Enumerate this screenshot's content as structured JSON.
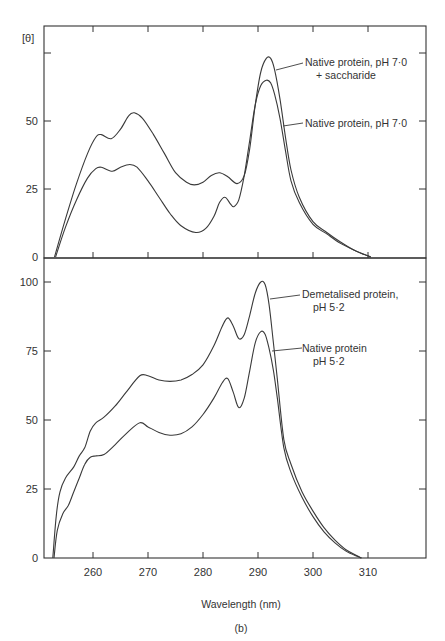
{
  "figure": {
    "panel_label": "(b)",
    "xlabel": "Wavelength (nm)",
    "ylabel": "[θ]"
  },
  "chart_data": [
    {
      "type": "line",
      "title": "",
      "xlabel": "Wavelength (nm)",
      "ylabel": "[θ]",
      "xlim": [
        250,
        320
      ],
      "ylim": [
        0,
        85
      ],
      "yticks": [
        0,
        25,
        50,
        75
      ],
      "ytick_labels": [
        "0",
        "25",
        "50",
        ""
      ],
      "xticks": [
        260,
        270,
        280,
        290,
        300,
        310
      ],
      "grid": false,
      "series": [
        {
          "name": "Native protein, pH 7·0 + saccharide",
          "label_lines": [
            "Native protein, pH 7·0",
            "+ saccharide"
          ],
          "x": [
            253,
            255,
            257,
            259,
            260.5,
            261.5,
            263.3,
            265,
            266.5,
            267.5,
            269,
            271,
            273,
            275,
            277,
            278.4,
            280,
            281.5,
            283,
            284.5,
            286.2,
            287.5,
            288.5,
            289.5,
            290.5,
            291.5,
            292.3,
            293,
            294,
            295,
            296,
            297.5,
            300,
            302.5,
            305,
            307.5,
            310.5
          ],
          "y": [
            0,
            14,
            27,
            38,
            44,
            45,
            43.5,
            47,
            52,
            53,
            51,
            45,
            38,
            31,
            27.5,
            26.5,
            27.5,
            30,
            31,
            29.5,
            27,
            30,
            40,
            56,
            68,
            73,
            73,
            69,
            58,
            44,
            32,
            22,
            13,
            9,
            5.5,
            2.5,
            0
          ]
        },
        {
          "name": "Native protein, pH 7·0",
          "label_lines": [
            "Native protein, pH 7·0"
          ],
          "x": [
            253.2,
            255,
            257,
            259,
            260.5,
            261.5,
            263.5,
            265,
            266.7,
            268,
            270,
            272,
            274,
            276,
            278.7,
            280.5,
            282,
            283,
            284,
            285,
            285.6,
            286.5,
            287.5,
            288.5,
            289.5,
            290.5,
            291.5,
            292.3,
            293,
            294,
            295,
            296,
            297.5,
            300,
            302.5,
            305,
            307.5,
            310.5
          ],
          "y": [
            0,
            11,
            21,
            29,
            32.5,
            33,
            31.5,
            33,
            34,
            33,
            28,
            22,
            16,
            11.5,
            9,
            10.5,
            15,
            20,
            22,
            19.5,
            18.5,
            21,
            30,
            43,
            56,
            63,
            65,
            64,
            60,
            51,
            39,
            28,
            20,
            12,
            8.5,
            5,
            2.5,
            0
          ]
        }
      ]
    },
    {
      "type": "line",
      "title": "",
      "xlabel": "Wavelength (nm)",
      "ylabel": "[θ]",
      "xlim": [
        250,
        320
      ],
      "ylim": [
        0,
        108
      ],
      "yticks": [
        0,
        25,
        50,
        75,
        100
      ],
      "ytick_labels": [
        "0",
        "25",
        "50",
        "75",
        "100"
      ],
      "xticks": [
        260,
        270,
        280,
        290,
        300,
        310
      ],
      "xtick_labels": [
        "260",
        "270",
        "280",
        "290",
        "300",
        "310"
      ],
      "grid": false,
      "series": [
        {
          "name": "Demetalised protein, pH 5·2",
          "label_lines": [
            "Demetalised protein,",
            "pH 5·2"
          ],
          "x": [
            252.7,
            253.3,
            254,
            255,
            256.5,
            257.5,
            258.5,
            259.5,
            260.5,
            262,
            264,
            266,
            268.5,
            270,
            272,
            274,
            276,
            278,
            280,
            282,
            283.5,
            284.5,
            285.5,
            286.5,
            287.5,
            288.5,
            289.5,
            290.5,
            291.3,
            292,
            292.8,
            293.5,
            294.7,
            296,
            298,
            300,
            302,
            304,
            306,
            308,
            308.8
          ],
          "y": [
            0,
            15,
            24,
            29,
            33,
            37,
            40,
            46,
            49,
            51,
            55,
            60,
            66,
            66,
            64.5,
            64,
            64.5,
            66.5,
            70,
            77,
            84,
            87,
            84,
            79.5,
            81,
            88,
            96,
            100,
            99,
            92,
            78,
            65,
            43,
            34,
            24,
            17,
            11,
            6.5,
            3,
            0.8,
            0
          ]
        },
        {
          "name": "Native protein pH 5·2",
          "label_lines": [
            "Native protein",
            "pH 5·2"
          ],
          "x": [
            252.9,
            253.5,
            254.5,
            255.5,
            256.5,
            257.5,
            258.5,
            259.5,
            260.5,
            262,
            264,
            266,
            268.5,
            270,
            272,
            274,
            276,
            278,
            280,
            282,
            283.5,
            284.5,
            285.5,
            286.5,
            287.5,
            288.5,
            289.5,
            290.5,
            291.3,
            292,
            292.8,
            293.5,
            294.7,
            296,
            298,
            300,
            302,
            304,
            306,
            308,
            308.8
          ],
          "y": [
            0,
            10,
            16,
            19,
            24,
            29,
            34,
            36.5,
            37,
            37.5,
            41,
            45,
            49,
            47.5,
            45.5,
            44.5,
            45,
            47.5,
            52,
            58,
            63.5,
            65,
            60,
            54.5,
            58,
            68,
            78,
            82,
            81,
            76,
            68,
            58,
            40,
            31,
            22,
            15,
            9.5,
            5.5,
            2.5,
            0.6,
            0
          ]
        }
      ]
    }
  ]
}
